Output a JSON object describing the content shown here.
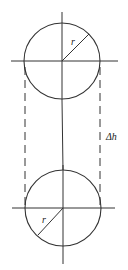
{
  "diagram": {
    "stroke_color": "#333333",
    "top_circle": {
      "center": [
        62,
        61
      ],
      "radius": 38,
      "radius_label": "r"
    },
    "bottom_circle": {
      "center": [
        63,
        208
      ],
      "radius": 38,
      "radius_label": "r"
    },
    "offset_label": "Δh"
  }
}
